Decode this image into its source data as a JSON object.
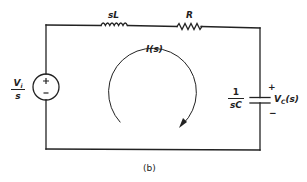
{
  "figure": {
    "caption": "(b)",
    "colors": {
      "ink": "#222222",
      "background": "#ffffff"
    }
  },
  "components": {
    "source": {
      "type": "voltage-source",
      "label_num": "V",
      "label_sub": "i",
      "label_den": "s",
      "plus": "+",
      "minus": "−"
    },
    "inductor": {
      "type": "inductor",
      "label": "sL"
    },
    "resistor": {
      "type": "resistor",
      "label": "R"
    },
    "capacitor": {
      "type": "capacitor",
      "label_num": "1",
      "label_den": "sC",
      "voltage_label": "V",
      "voltage_sub": "C",
      "voltage_arg": "(s)",
      "plus": "+",
      "minus": "−"
    }
  },
  "loop_current": {
    "label": "I(s)",
    "direction": "clockwise"
  }
}
